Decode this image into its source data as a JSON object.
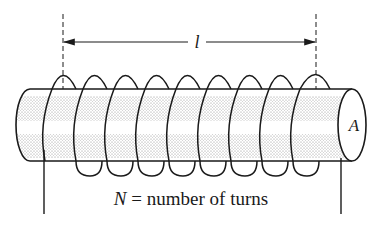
{
  "diagram": {
    "type": "solenoid",
    "length_label": "l",
    "area_label": "A",
    "caption": {
      "symbol": "N",
      "text": " = number of turns"
    },
    "turns_visible": 9,
    "colors": {
      "stroke": "#1a1a1a",
      "stipple": "#9a9a9a",
      "background": "#ffffff"
    }
  }
}
